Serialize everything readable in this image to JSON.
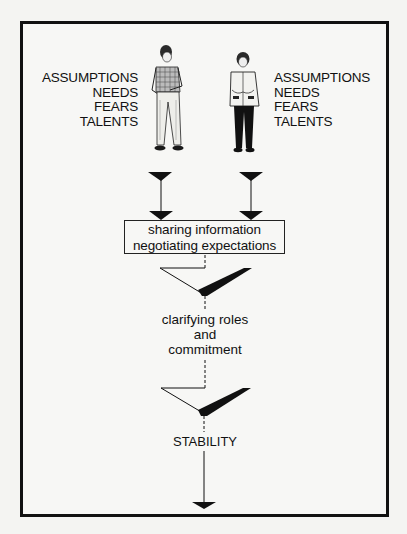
{
  "diagram": {
    "left_person": {
      "description": "young man in checked shirt",
      "attributes": [
        "ASSUMPTIONS",
        "NEEDS",
        "FEARS",
        "TALENTS"
      ]
    },
    "right_person": {
      "description": "young woman in jacket",
      "attributes": [
        "ASSUMPTIONS",
        "NEEDS",
        "FEARS",
        "TALENTS"
      ]
    },
    "process_box": {
      "line1": "sharing information",
      "line2": "negotiating expectations"
    },
    "stage2": {
      "line1": "clarifying roles",
      "line2": "and",
      "line3": "commitment"
    },
    "outcome": "STABILITY",
    "colors": {
      "ink": "#111111",
      "background": "#f7f7f5"
    }
  }
}
